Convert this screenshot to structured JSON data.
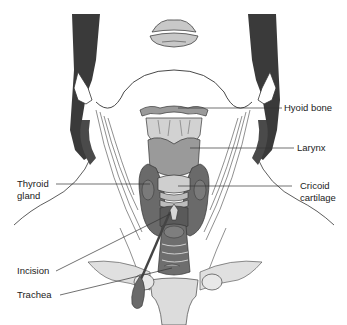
{
  "diagram": {
    "labels": {
      "hyoid_bone": "Hyoid bone",
      "larynx": "Larynx",
      "thyroid_gland_line1": "Thyroid",
      "thyroid_gland_line2": "gland",
      "cricoid_line1": "Cricoid",
      "cricoid_line2": "cartilage",
      "incision": "Incision",
      "trachea": "Trachea"
    },
    "colors": {
      "dark_tissue": "#4a4a4a",
      "thyroid": "#6e6e6e",
      "cartilage_light": "#c8c8c8",
      "larynx_mid": "#8e8e8e",
      "outline": "#333333",
      "skin_bg": "#ffffff"
    }
  }
}
